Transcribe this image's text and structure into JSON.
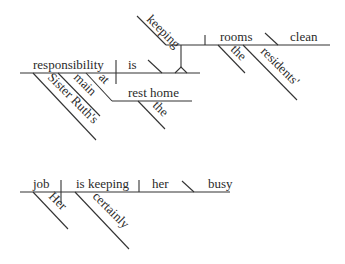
{
  "diagram": {
    "type": "sentence-diagram",
    "sentences": [
      {
        "id": "s1",
        "subject": "responsibility",
        "subject_modifiers": [
          "Sister Ruth's",
          "main",
          "at"
        ],
        "prepositional_object": "rest home",
        "prepositional_object_modifiers": [
          "the"
        ],
        "verb": "is",
        "predicate_noun_clause": {
          "gerund": "keeping",
          "object": "rooms",
          "object_modifiers": [
            "the",
            "residents'"
          ],
          "object_complement": "clean"
        }
      },
      {
        "id": "s2",
        "subject": "job",
        "subject_modifiers": [
          "Her"
        ],
        "verb": "is keeping",
        "verb_modifiers": [
          "certainly"
        ],
        "object": "her",
        "object_complement": "busy"
      }
    ]
  },
  "words": {
    "keeping": "keeping",
    "rooms": "rooms",
    "clean": "clean",
    "the1": "the",
    "residents": "residents'",
    "responsibility": "responsibility",
    "is": "is",
    "main": "main",
    "at": "at",
    "sister_ruths": "Sister Ruth's",
    "rest_home": "rest home",
    "the2": "the",
    "job": "job",
    "is_keeping": "is keeping",
    "her": "her",
    "busy": "busy",
    "her_cap": "Her",
    "certainly": "certainly"
  }
}
